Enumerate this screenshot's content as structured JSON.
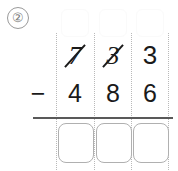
{
  "worksheet": {
    "problem_number": "②",
    "operation_symbol": "−",
    "operation_name": "subtraction",
    "rule_color": "#595959",
    "divider_color": "#b9b9b9",
    "box_border_color": "#b0b0b0",
    "ink_color": "#1a1a1a",
    "columns": [
      {
        "place": "hundreds"
      },
      {
        "place": "tens"
      },
      {
        "place": "ones"
      }
    ],
    "carry_boxes": [
      {
        "value": "",
        "label": "regroup-box-hundreds"
      },
      {
        "value": "",
        "label": "regroup-box-tens"
      },
      {
        "value": "",
        "label": "regroup-box-ones"
      }
    ],
    "minuend": {
      "value": "733",
      "digits": [
        {
          "text": "7",
          "struck": true
        },
        {
          "text": "3",
          "struck": true
        },
        {
          "text": "3",
          "struck": false
        }
      ]
    },
    "subtrahend": {
      "value": "486",
      "digits": [
        {
          "text": "4",
          "struck": false
        },
        {
          "text": "8",
          "struck": false
        },
        {
          "text": "6",
          "struck": false
        }
      ]
    },
    "answer": {
      "digits": [
        {
          "text": ""
        },
        {
          "text": ""
        },
        {
          "text": ""
        }
      ]
    }
  }
}
